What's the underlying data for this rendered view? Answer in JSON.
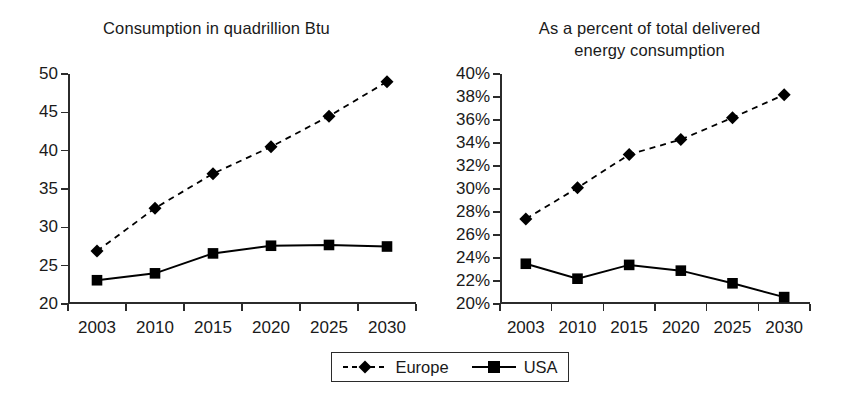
{
  "charts": [
    {
      "id": "consumption",
      "title": "Consumption in quadrillion Btu"
    },
    {
      "id": "percent",
      "title_line1": "As a percent of total delivered",
      "title_line2": "energy consumption"
    }
  ],
  "legend": {
    "entries": [
      {
        "label": "Europe",
        "marker": "diamond",
        "line": "dashed",
        "color": "#000000"
      },
      {
        "label": "USA",
        "marker": "square",
        "line": "solid",
        "color": "#000000"
      }
    ]
  },
  "chart_data": [
    {
      "type": "line",
      "title": "Consumption in quadrillion Btu",
      "xlabel": "",
      "ylabel": "",
      "categories": [
        "2003",
        "2010",
        "2015",
        "2020",
        "2025",
        "2030"
      ],
      "ylim": [
        20,
        50
      ],
      "yticks": [
        20,
        25,
        30,
        35,
        40,
        45,
        50
      ],
      "ytick_labels": [
        "20",
        "25",
        "30",
        "35",
        "40",
        "45",
        "50"
      ],
      "grid": false,
      "legend_position": "bottom",
      "series": [
        {
          "name": "Europe",
          "marker": "diamond",
          "line": "dashed",
          "values": [
            26.9,
            32.5,
            37.0,
            40.5,
            44.5,
            49.0
          ]
        },
        {
          "name": "USA",
          "marker": "square",
          "line": "solid",
          "values": [
            23.1,
            24.0,
            26.6,
            27.6,
            27.7,
            27.5
          ]
        }
      ]
    },
    {
      "type": "line",
      "title": "As a percent of total delivered energy consumption",
      "xlabel": "",
      "ylabel": "",
      "categories": [
        "2003",
        "2010",
        "2015",
        "2020",
        "2025",
        "2030"
      ],
      "ylim": [
        20,
        40
      ],
      "yticks": [
        20,
        22,
        24,
        26,
        28,
        30,
        32,
        34,
        36,
        38,
        40
      ],
      "ytick_labels": [
        "20%",
        "22%",
        "24%",
        "26%",
        "28%",
        "30%",
        "32%",
        "34%",
        "36%",
        "38%",
        "40%"
      ],
      "grid": false,
      "legend_position": "bottom",
      "series": [
        {
          "name": "Europe",
          "marker": "diamond",
          "line": "dashed",
          "values": [
            27.4,
            30.1,
            33.0,
            34.3,
            36.2,
            38.2
          ]
        },
        {
          "name": "USA",
          "marker": "square",
          "line": "solid",
          "values": [
            23.5,
            22.2,
            23.4,
            22.9,
            21.8,
            20.6
          ]
        }
      ]
    }
  ]
}
